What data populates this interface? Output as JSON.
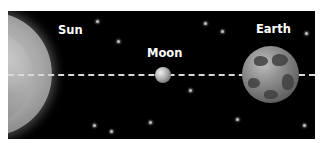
{
  "diagram": {
    "background": "#000000",
    "bodies": [
      {
        "name": "Sun",
        "label": "Sun",
        "color": "#a8a8a8"
      },
      {
        "name": "Moon",
        "label": "Moon",
        "color": "#b5b5b5"
      },
      {
        "name": "Earth",
        "label": "Earth",
        "color": "#8e8e8e"
      }
    ],
    "alignment_line": {
      "style": "dashed",
      "color": "#d8d8d8"
    }
  }
}
